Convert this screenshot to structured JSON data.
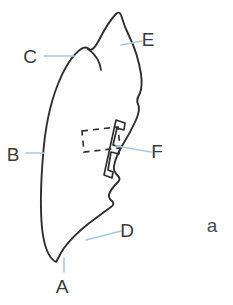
{
  "figure": {
    "panel_label": "a",
    "background_color": "#ffffff",
    "outline_color": "#2e2e33",
    "leader_color": "#a9c9de",
    "label_color": "#3b3b3d",
    "labels": [
      {
        "id": "A",
        "text": "A",
        "x": 62,
        "y": 288,
        "leader": "M 64 272 L 64 258"
      },
      {
        "id": "B",
        "text": "B",
        "x": 13,
        "y": 156,
        "leader": "M 26 153 L 44 153"
      },
      {
        "id": "C",
        "text": "C",
        "x": 30,
        "y": 58,
        "leader": "M 44 56 L 74 56"
      },
      {
        "id": "D",
        "text": "D",
        "x": 127,
        "y": 232,
        "leader": "M 121 231 L 86 240"
      },
      {
        "id": "E",
        "text": "E",
        "x": 148,
        "y": 41,
        "leader": "M 142 41 L 121 45"
      },
      {
        "id": "F",
        "text": "F",
        "x": 157,
        "y": 153,
        "leader": "M 151 152 L 116 146"
      }
    ],
    "shapes": {
      "outline": "M 56 262 C 48 258 44 246 42 228 C 40 206 41 180 43 156 C 45 128 50 104 58 84 C 66 64 74 54 81 49 C 84 47 87 47 89 49 C 91 51 94 49 98 42 C 104 30 110 20 116 14 C 118 12 120 12 121 15 C 123 22 126 30 130 38 C 136 50 139 62 141 74 C 142 82 142 88 140 93 C 138 97 136 100 138 104 C 140 108 139 113 136 120 C 132 129 127 138 122 146 C 118 153 115 160 114 166 C 113 170 115 173 118 176 C 120 178 120 180 118 182 C 115 185 112 188 110 192 C 108 196 109 199 112 201 C 114 203 114 205 111 207 C 104 212 96 218 88 224 C 78 232 70 240 64 248 C 60 254 58 259 56 262 Z",
      "arc_detail": "M 88 49 C 95 54 100 62 101 70",
      "solid_inclusion": "M 116 120 L 125 123 L 124 130 L 117 128 L 113 145 L 120 147 L 119 154 L 111 152 L 108 170 L 113 172 L 112 178 L 104 175 Z",
      "dashed_box": "M 82 131 L 118 127 L 120 148 L 84 152 Z"
    }
  }
}
